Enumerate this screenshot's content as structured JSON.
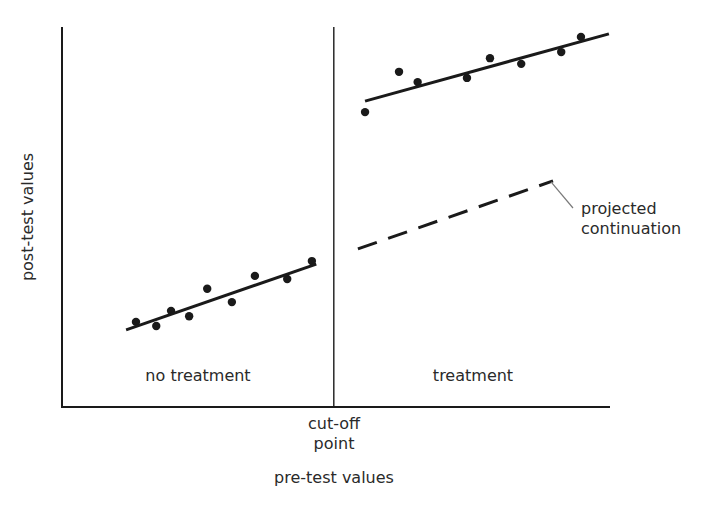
{
  "chart_data": {
    "type": "scatter",
    "title": "",
    "xlabel": "pre-test values",
    "ylabel": "post-test values",
    "xlim": [
      0,
      100
    ],
    "ylim": [
      0,
      100
    ],
    "grid": false,
    "legend": null,
    "cutoff": {
      "x": 49.6,
      "label": "cut-off point",
      "label_lines": [
        "cut-off",
        "point"
      ]
    },
    "regions": [
      {
        "name": "no treatment",
        "label": "no treatment"
      },
      {
        "name": "treatment",
        "label": "treatment"
      }
    ],
    "series": [
      {
        "name": "no treatment",
        "kind": "points",
        "points": [
          {
            "x": 13.5,
            "y": 22.4
          },
          {
            "x": 17.2,
            "y": 21.3
          },
          {
            "x": 19.9,
            "y": 25.3
          },
          {
            "x": 23.2,
            "y": 23.9
          },
          {
            "x": 26.5,
            "y": 31.1
          },
          {
            "x": 31.0,
            "y": 27.6
          },
          {
            "x": 35.2,
            "y": 34.5
          },
          {
            "x": 41.1,
            "y": 33.7
          },
          {
            "x": 45.6,
            "y": 38.4
          }
        ]
      },
      {
        "name": "no treatment fit",
        "kind": "line",
        "points": [
          {
            "x": 11.7,
            "y": 20.3
          },
          {
            "x": 46.4,
            "y": 37.6
          }
        ]
      },
      {
        "name": "treatment",
        "kind": "points",
        "points": [
          {
            "x": 55.3,
            "y": 77.6
          },
          {
            "x": 61.5,
            "y": 88.2
          },
          {
            "x": 64.9,
            "y": 85.5
          },
          {
            "x": 73.9,
            "y": 86.6
          },
          {
            "x": 78.1,
            "y": 91.8
          },
          {
            "x": 83.8,
            "y": 90.3
          },
          {
            "x": 91.1,
            "y": 93.4
          },
          {
            "x": 94.7,
            "y": 97.4
          }
        ]
      },
      {
        "name": "treatment fit",
        "kind": "line",
        "points": [
          {
            "x": 55.3,
            "y": 80.5
          },
          {
            "x": 99.8,
            "y": 98.2
          }
        ]
      },
      {
        "name": "projected continuation",
        "kind": "dashed-line",
        "points": [
          {
            "x": 54.0,
            "y": 41.6
          },
          {
            "x": 89.6,
            "y": 59.5
          }
        ]
      }
    ],
    "annotations": [
      {
        "text": "projected continuation",
        "lines": [
          "projected",
          "continuation"
        ],
        "points_to": "projected continuation"
      }
    ]
  },
  "labels": {
    "ylabel": "post-test values",
    "xlabel": "pre-test values",
    "cutoff_line1": "cut-off",
    "cutoff_line2": "point",
    "region_left": "no treatment",
    "region_right": "treatment",
    "annotation_line1": "projected",
    "annotation_line2": "continuation"
  },
  "style": {
    "ink": "#1a1a1a",
    "leader": "#7a7a7a",
    "text": "#2a2a2a"
  }
}
